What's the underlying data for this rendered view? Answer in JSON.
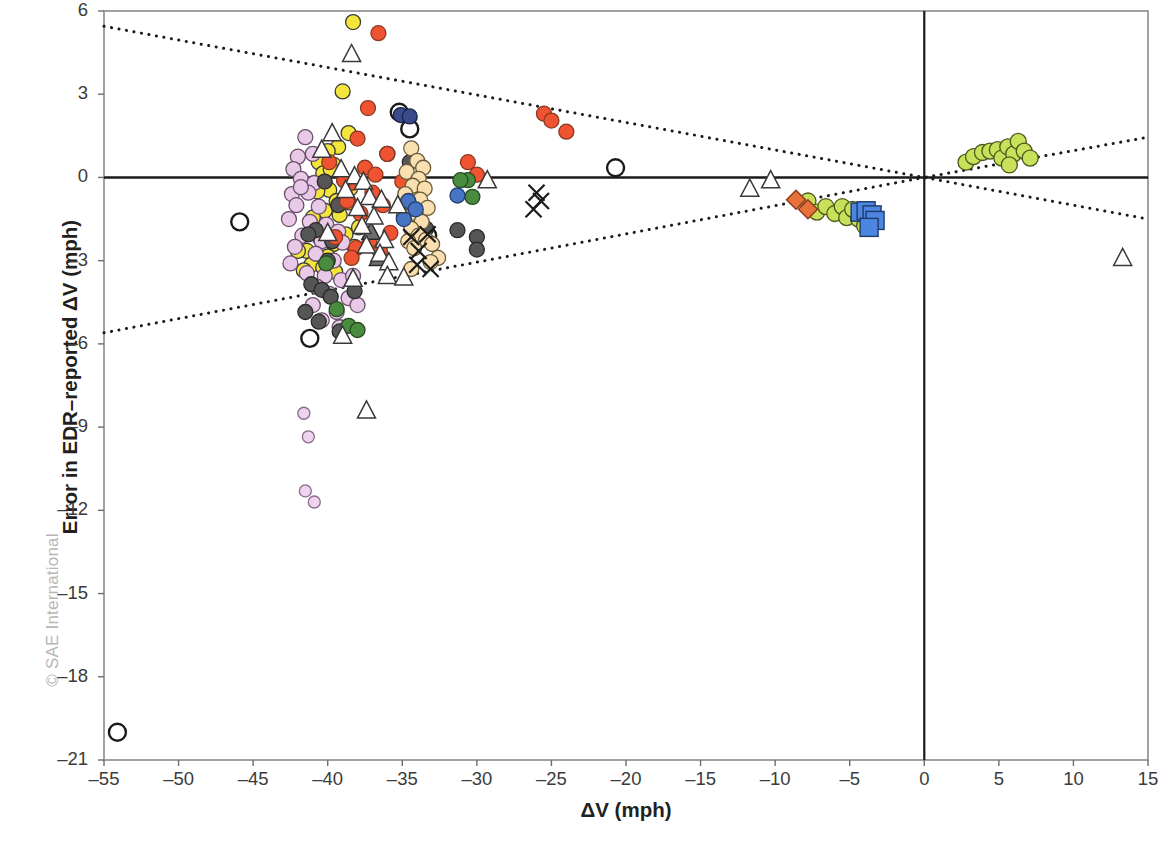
{
  "watermark": "© SAE International",
  "axes": {
    "x_title": "ΔV (mph)",
    "y_title": "Error in EDR–reported ΔV (mph)",
    "x_ticks": [
      "-55",
      "-50",
      "-45",
      "-40",
      "-35",
      "-30",
      "-25",
      "-20",
      "-15",
      "-10",
      "-5",
      "0",
      "5",
      "10",
      "15"
    ],
    "y_ticks": [
      "6",
      "3",
      "0",
      "-3",
      "-6",
      "-9",
      "-12",
      "-15",
      "-18",
      "-21"
    ]
  },
  "chart_data": {
    "type": "scatter",
    "title": "",
    "xlabel": "ΔV (mph)",
    "ylabel": "Error in EDR–reported ΔV (mph)",
    "xlim": [
      -55,
      15
    ],
    "ylim": [
      -21,
      6
    ],
    "xtick_step": 5,
    "ytick_step": 3,
    "grid": false,
    "legend": "none",
    "reference_lines": [
      {
        "name": "x-zero-axis",
        "type": "vertical",
        "value": 0,
        "style": "solid",
        "color": "#1a1a1a"
      },
      {
        "name": "y-zero-axis",
        "type": "horizontal",
        "value": 0,
        "style": "solid",
        "color": "#1a1a1a"
      },
      {
        "name": "upper-bound-band",
        "type": "line",
        "style": "dotted",
        "color": "#1a1a1a",
        "points": [
          [
            -55,
            5.45
          ],
          [
            0,
            0.0
          ],
          [
            15,
            1.45
          ]
        ]
      },
      {
        "name": "lower-bound-band",
        "type": "line",
        "style": "dotted",
        "color": "#1a1a1a",
        "points": [
          [
            -55,
            -5.6
          ],
          [
            0,
            0.0
          ],
          [
            15,
            -1.5
          ]
        ]
      }
    ],
    "marker_styles": {
      "yellow-circle": {
        "fill": "#F4E53B",
        "stroke": "#3a3a3a",
        "shape": "circle",
        "r": 7.5
      },
      "plum-circle": {
        "fill": "#E9C9E8",
        "stroke": "#6b4f6b",
        "shape": "circle",
        "r": 7.5
      },
      "plum-circle-small": {
        "fill": "#EED3EE",
        "stroke": "#8a6b8a",
        "shape": "circle",
        "r": 6.0
      },
      "gray-circle": {
        "fill": "#565656",
        "stroke": "#2a2a2a",
        "shape": "circle",
        "r": 7.5
      },
      "orange-circle": {
        "fill": "#F05332",
        "stroke": "#8a3a22",
        "shape": "circle",
        "r": 7.5
      },
      "tan-circle": {
        "fill": "#FAE0B0",
        "stroke": "#6b5a3a",
        "shape": "circle",
        "r": 7.5
      },
      "green-circle": {
        "fill": "#4A8C3F",
        "stroke": "#2a4a22",
        "shape": "circle",
        "r": 7.5
      },
      "yellowgreen-circle": {
        "fill": "#C8E05A",
        "stroke": "#4a5a1a",
        "shape": "circle",
        "r": 8.0
      },
      "blue-circle": {
        "fill": "#4874C4",
        "stroke": "#23406e",
        "shape": "circle",
        "r": 7.5
      },
      "navy-circle": {
        "fill": "#3A4A8C",
        "stroke": "#1a2246",
        "shape": "circle",
        "r": 7.5
      },
      "open-circle": {
        "fill": "none",
        "stroke": "#1a1a1a",
        "shape": "circle",
        "r": 8.5
      },
      "open-triangle": {
        "fill": "#ffffff",
        "stroke": "#3a3a3a",
        "shape": "triangle",
        "r": 9.5
      },
      "gray-triangle": {
        "fill": "#6e6e6e",
        "stroke": "#2a2a2a",
        "shape": "triangle",
        "r": 9.5
      },
      "x-mark": {
        "fill": "none",
        "stroke": "#1a1a1a",
        "shape": "x",
        "r": 8.0
      },
      "blue-square": {
        "fill": "#4D86E0",
        "stroke": "#203a6e",
        "shape": "square",
        "r": 9.0
      },
      "orange-diamond": {
        "fill": "#E8703A",
        "stroke": "#8a3a1a",
        "shape": "diamond",
        "r": 9.5
      }
    },
    "series": [
      {
        "name": "open-circle",
        "style": "open-circle",
        "points": [
          [
            -54.1,
            -20.0
          ],
          [
            -45.9,
            -1.6
          ],
          [
            -41.2,
            -5.8
          ],
          [
            -35.2,
            2.35
          ],
          [
            -34.5,
            1.75
          ],
          [
            -20.7,
            0.35
          ],
          [
            -33.3,
            -2.1
          ]
        ]
      },
      {
        "name": "yellow-circle",
        "style": "yellow-circle",
        "points": [
          [
            -38.3,
            5.6
          ],
          [
            -39.0,
            3.1
          ],
          [
            -38.6,
            1.6
          ],
          [
            -39.3,
            1.1
          ],
          [
            -40.0,
            0.95
          ],
          [
            -40.6,
            0.55
          ],
          [
            -39.6,
            0.45
          ],
          [
            -40.3,
            0.15
          ],
          [
            -38.9,
            -0.1
          ],
          [
            -39.9,
            -0.45
          ],
          [
            -40.7,
            -0.5
          ],
          [
            -39.4,
            -0.85
          ],
          [
            -38.6,
            -0.9
          ],
          [
            -40.2,
            -1.2
          ],
          [
            -39.2,
            -1.35
          ],
          [
            -41.0,
            -1.45
          ],
          [
            -38.8,
            -2.05
          ],
          [
            -40.5,
            -2.2
          ],
          [
            -39.6,
            -2.4
          ],
          [
            -41.4,
            -2.65
          ],
          [
            -40.0,
            -2.85
          ],
          [
            -41.1,
            -3.15
          ],
          [
            -40.3,
            -3.25
          ],
          [
            -42.0,
            -2.65
          ],
          [
            -41.6,
            -3.35
          ],
          [
            -39.5,
            -3.4
          ],
          [
            -38.5,
            -0.4
          ],
          [
            -39.8,
            0.3
          ],
          [
            -37.9,
            -1.8
          ],
          [
            -38.2,
            -2.5
          ]
        ]
      },
      {
        "name": "plum-circle",
        "style": "plum-circle",
        "points": [
          [
            -41.5,
            1.45
          ],
          [
            -42.0,
            0.75
          ],
          [
            -41.0,
            0.85
          ],
          [
            -42.3,
            0.3
          ],
          [
            -41.8,
            -0.05
          ],
          [
            -40.9,
            -0.2
          ],
          [
            -42.4,
            -0.6
          ],
          [
            -41.3,
            -0.55
          ],
          [
            -42.1,
            -1.0
          ],
          [
            -40.6,
            -1.05
          ],
          [
            -42.6,
            -1.5
          ],
          [
            -41.2,
            -1.6
          ],
          [
            -40.1,
            -1.7
          ],
          [
            -39.3,
            -1.95
          ],
          [
            -41.7,
            -2.1
          ],
          [
            -40.4,
            -2.3
          ],
          [
            -39.0,
            -2.35
          ],
          [
            -42.2,
            -2.5
          ],
          [
            -40.8,
            -2.75
          ],
          [
            -39.6,
            -3.0
          ],
          [
            -41.4,
            -3.45
          ],
          [
            -40.2,
            -3.55
          ],
          [
            -39.1,
            -3.7
          ],
          [
            -38.3,
            -3.55
          ],
          [
            -40.7,
            -3.95
          ],
          [
            -39.9,
            -4.2
          ],
          [
            -38.6,
            -4.35
          ],
          [
            -41.0,
            -4.6
          ],
          [
            -39.4,
            -4.85
          ],
          [
            -38.0,
            -4.6
          ],
          [
            -40.4,
            -5.15
          ],
          [
            -39.2,
            -5.4
          ],
          [
            -41.8,
            -0.35
          ],
          [
            -42.5,
            -3.1
          ]
        ]
      },
      {
        "name": "plum-circle-small",
        "style": "plum-circle-small",
        "points": [
          [
            -41.6,
            -8.5
          ],
          [
            -41.3,
            -9.35
          ],
          [
            -41.5,
            -11.3
          ],
          [
            -40.9,
            -11.7
          ]
        ]
      },
      {
        "name": "gray-circle",
        "style": "gray-circle",
        "points": [
          [
            -40.2,
            -0.15
          ],
          [
            -36.0,
            0.85
          ],
          [
            -39.3,
            -1.0
          ],
          [
            -34.5,
            0.55
          ],
          [
            -40.8,
            -1.9
          ],
          [
            -41.3,
            -2.05
          ],
          [
            -39.7,
            -2.3
          ],
          [
            -40.0,
            -3.0
          ],
          [
            -41.1,
            -3.85
          ],
          [
            -40.4,
            -4.05
          ],
          [
            -39.8,
            -4.3
          ],
          [
            -41.5,
            -4.85
          ],
          [
            -40.6,
            -5.2
          ],
          [
            -30.0,
            -2.15
          ],
          [
            -30.0,
            -2.6
          ],
          [
            -31.3,
            -1.9
          ],
          [
            -33.4,
            -1.85
          ],
          [
            -39.2,
            -5.55
          ],
          [
            -38.2,
            -4.1
          ]
        ]
      },
      {
        "name": "orange-circle",
        "style": "orange-circle",
        "points": [
          [
            -36.6,
            5.2
          ],
          [
            -37.3,
            2.5
          ],
          [
            -38.0,
            1.4
          ],
          [
            -36.0,
            0.85
          ],
          [
            -37.5,
            0.35
          ],
          [
            -36.8,
            0.1
          ],
          [
            -38.4,
            -0.2
          ],
          [
            -37.0,
            -0.55
          ],
          [
            -38.7,
            -0.85
          ],
          [
            -36.3,
            -1.0
          ],
          [
            -37.8,
            -1.3
          ],
          [
            -38.9,
            -0.1
          ],
          [
            -25.5,
            2.3
          ],
          [
            -25.0,
            2.05
          ],
          [
            -24.0,
            1.65
          ],
          [
            -30.6,
            0.55
          ],
          [
            -30.0,
            0.1
          ],
          [
            -35.8,
            -2.0
          ],
          [
            -37.2,
            -2.3
          ],
          [
            -38.1,
            -2.55
          ],
          [
            -36.5,
            -2.65
          ],
          [
            -34.2,
            -0.95
          ],
          [
            -33.8,
            -0.35
          ],
          [
            -35.0,
            -0.15
          ],
          [
            -39.9,
            0.55
          ],
          [
            -39.5,
            -2.15
          ],
          [
            -38.4,
            -2.9
          ]
        ]
      },
      {
        "name": "tan-circle",
        "style": "tan-circle",
        "points": [
          [
            -34.4,
            1.05
          ],
          [
            -34.0,
            0.6
          ],
          [
            -33.6,
            0.35
          ],
          [
            -34.7,
            0.2
          ],
          [
            -33.9,
            -0.05
          ],
          [
            -34.3,
            -0.3
          ],
          [
            -33.5,
            -0.4
          ],
          [
            -34.8,
            -0.6
          ],
          [
            -33.8,
            -0.8
          ],
          [
            -34.5,
            -1.0
          ],
          [
            -33.3,
            -1.1
          ],
          [
            -34.1,
            -1.3
          ],
          [
            -34.9,
            -1.4
          ],
          [
            -33.7,
            -1.6
          ],
          [
            -34.4,
            -1.85
          ],
          [
            -33.9,
            -2.1
          ],
          [
            -34.6,
            -2.3
          ],
          [
            -33.4,
            -2.25
          ],
          [
            -34.2,
            -2.55
          ],
          [
            -33.0,
            -2.4
          ],
          [
            -32.6,
            -2.9
          ],
          [
            -34.4,
            -3.3
          ],
          [
            -33.1,
            -3.05
          ]
        ]
      },
      {
        "name": "green-circle",
        "style": "green-circle",
        "points": [
          [
            -40.1,
            -3.1
          ],
          [
            -39.4,
            -4.75
          ],
          [
            -30.6,
            -0.1
          ],
          [
            -31.1,
            -0.1
          ],
          [
            -30.3,
            -0.7
          ],
          [
            -38.6,
            -5.35
          ],
          [
            -38.0,
            -5.5
          ]
        ]
      },
      {
        "name": "blue-circle",
        "style": "blue-circle",
        "points": [
          [
            -34.6,
            -0.85
          ],
          [
            -34.1,
            -1.15
          ],
          [
            -31.3,
            -0.65
          ],
          [
            -34.9,
            -1.5
          ]
        ]
      },
      {
        "name": "navy-circle",
        "style": "navy-circle",
        "points": [
          [
            -35.1,
            2.25
          ],
          [
            -34.5,
            2.2
          ]
        ]
      },
      {
        "name": "yellowgreen-circle",
        "style": "yellowgreen-circle",
        "points": [
          [
            -7.8,
            -0.85
          ],
          [
            -7.2,
            -1.25
          ],
          [
            -6.6,
            -1.05
          ],
          [
            -6.0,
            -1.3
          ],
          [
            -5.5,
            -1.05
          ],
          [
            -5.2,
            -1.45
          ],
          [
            -4.8,
            -1.15
          ],
          [
            -4.4,
            -1.5
          ],
          [
            -4.0,
            -1.75
          ],
          [
            -3.6,
            -1.55
          ],
          [
            2.8,
            0.55
          ],
          [
            3.3,
            0.75
          ],
          [
            3.9,
            0.9
          ],
          [
            4.4,
            0.95
          ],
          [
            4.9,
            1.0
          ],
          [
            5.2,
            0.7
          ],
          [
            5.6,
            1.1
          ],
          [
            6.0,
            0.85
          ],
          [
            6.3,
            1.3
          ],
          [
            6.7,
            0.95
          ],
          [
            7.1,
            0.7
          ],
          [
            5.7,
            0.45
          ]
        ]
      },
      {
        "name": "blue-square",
        "style": "blue-square",
        "points": [
          [
            -4.3,
            -1.25
          ],
          [
            -3.9,
            -1.2
          ],
          [
            -3.5,
            -1.35
          ],
          [
            -3.3,
            -1.55
          ],
          [
            -3.7,
            -1.8
          ]
        ]
      },
      {
        "name": "orange-diamond",
        "style": "orange-diamond",
        "points": [
          [
            -8.6,
            -0.8
          ],
          [
            -7.8,
            -1.15
          ]
        ]
      },
      {
        "name": "x-mark",
        "style": "x-mark",
        "points": [
          [
            -26.0,
            -0.55
          ],
          [
            -25.7,
            -0.85
          ],
          [
            -26.2,
            -1.15
          ],
          [
            -33.3,
            -2.05
          ],
          [
            -34.4,
            -2.15
          ],
          [
            -33.9,
            -2.65
          ],
          [
            -34.0,
            -3.15
          ],
          [
            -33.1,
            -3.3
          ]
        ]
      },
      {
        "name": "gray-triangle",
        "style": "gray-triangle",
        "points": [
          [
            -37.1,
            -1.95
          ],
          [
            -36.6,
            -2.9
          ]
        ]
      },
      {
        "name": "open-triangle",
        "style": "open-triangle",
        "points": [
          [
            -38.4,
            4.45
          ],
          [
            -39.7,
            1.6
          ],
          [
            -40.4,
            1.0
          ],
          [
            -39.1,
            0.3
          ],
          [
            -38.2,
            0.05
          ],
          [
            -37.6,
            -0.15
          ],
          [
            -38.8,
            -0.45
          ],
          [
            -37.2,
            -0.7
          ],
          [
            -36.4,
            -0.8
          ],
          [
            -38.0,
            -1.1
          ],
          [
            -36.9,
            -1.4
          ],
          [
            -37.7,
            -1.75
          ],
          [
            -36.2,
            -2.25
          ],
          [
            -37.4,
            -2.45
          ],
          [
            -36.5,
            -2.75
          ],
          [
            -35.9,
            -3.05
          ],
          [
            -36.0,
            -3.55
          ],
          [
            -34.9,
            -3.6
          ],
          [
            -39.0,
            -5.7
          ],
          [
            -37.4,
            -8.4
          ],
          [
            -29.3,
            -0.1
          ],
          [
            -11.7,
            -0.4
          ],
          [
            -10.3,
            -0.1
          ],
          [
            13.3,
            -2.9
          ],
          [
            -35.3,
            -1.0
          ],
          [
            -38.3,
            -3.65
          ],
          [
            -40.0,
            -2.0
          ]
        ]
      }
    ]
  }
}
